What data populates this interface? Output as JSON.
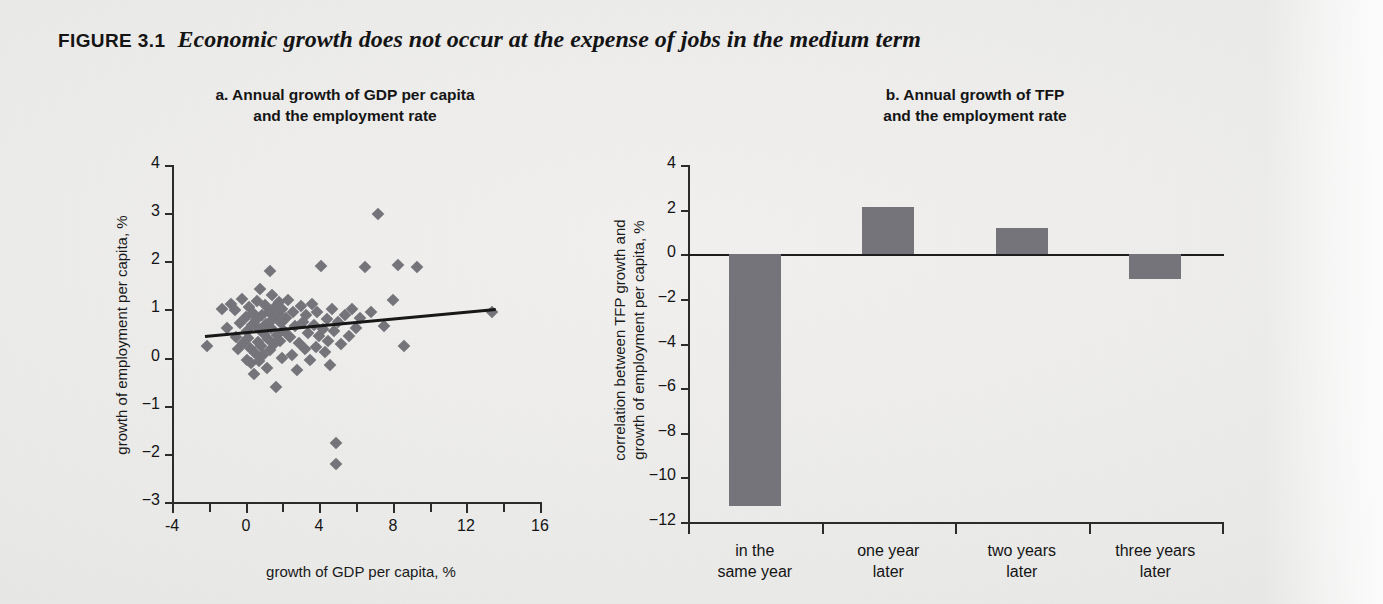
{
  "figure": {
    "tag": "FIGURE 3.1",
    "title": "Economic growth does not occur at the expense of jobs in the medium term"
  },
  "colors": {
    "marker": "#75747a",
    "bar": "#75747a",
    "axis": "#2b2b2b",
    "trendline": "#171717",
    "page_background": "#ececeb"
  },
  "panel_a": {
    "title_line1": "a.  Annual growth of GDP per capita",
    "title_line2": "and the employment rate",
    "chart_data": {
      "type": "scatter",
      "title": "a. Annual growth of GDP per capita and the employment rate",
      "xlabel": "growth of GDP per capita, %",
      "ylabel": "growth of employment per capita, %",
      "xlim": [
        -4,
        16
      ],
      "ylim": [
        -3,
        4
      ],
      "xticks": [
        -4,
        0,
        4,
        8,
        12,
        16
      ],
      "xtick_labels": [
        "-4",
        "0",
        "4",
        "8",
        "12",
        "16"
      ],
      "xminor_step": 2,
      "yticks": [
        -3,
        -2,
        -1,
        0,
        1,
        2,
        3,
        4
      ],
      "ytick_labels": [
        "−3",
        "−2",
        "−1",
        "0",
        "1",
        "2",
        "3",
        "4"
      ],
      "grid": false,
      "legend": "none",
      "trendline": {
        "x0": -2.2,
        "y0": 0.46,
        "x1": 13.6,
        "y1": 1.02
      },
      "points": [
        [
          -2.1,
          0.25
        ],
        [
          -1.3,
          1.0
        ],
        [
          -1.0,
          0.62
        ],
        [
          -0.8,
          1.12
        ],
        [
          -0.6,
          0.98
        ],
        [
          -0.5,
          0.43
        ],
        [
          -0.4,
          0.18
        ],
        [
          -0.3,
          0.72
        ],
        [
          -0.2,
          1.22
        ],
        [
          -0.15,
          0.3
        ],
        [
          0.0,
          0.85
        ],
        [
          0.05,
          0.55
        ],
        [
          0.1,
          -0.05
        ],
        [
          0.15,
          0.4
        ],
        [
          0.2,
          1.05
        ],
        [
          0.25,
          0.2
        ],
        [
          0.3,
          -0.12
        ],
        [
          0.35,
          0.68
        ],
        [
          0.4,
          0.92
        ],
        [
          0.45,
          -0.35
        ],
        [
          0.5,
          0.1
        ],
        [
          0.55,
          0.78
        ],
        [
          0.6,
          1.18
        ],
        [
          0.65,
          0.33
        ],
        [
          0.7,
          -0.08
        ],
        [
          0.75,
          0.6
        ],
        [
          0.8,
          1.42
        ],
        [
          0.85,
          0.25
        ],
        [
          0.9,
          0.88
        ],
        [
          0.95,
          0.05
        ],
        [
          1.0,
          0.5
        ],
        [
          1.05,
          1.1
        ],
        [
          1.1,
          0.7
        ],
        [
          1.15,
          -0.22
        ],
        [
          1.2,
          0.38
        ],
        [
          1.25,
          0.95
        ],
        [
          1.3,
          1.8
        ],
        [
          1.35,
          0.15
        ],
        [
          1.4,
          0.62
        ],
        [
          1.45,
          1.3
        ],
        [
          1.5,
          0.8
        ],
        [
          1.55,
          0.28
        ],
        [
          1.6,
          1.05
        ],
        [
          1.65,
          -0.6
        ],
        [
          1.7,
          0.48
        ],
        [
          1.75,
          0.9
        ],
        [
          1.8,
          1.15
        ],
        [
          1.85,
          0.35
        ],
        [
          1.9,
          0.72
        ],
        [
          1.95,
          0.0
        ],
        [
          2.0,
          1.0
        ],
        [
          2.1,
          0.55
        ],
        [
          2.2,
          0.82
        ],
        [
          2.3,
          1.2
        ],
        [
          2.4,
          0.42
        ],
        [
          2.5,
          0.05
        ],
        [
          2.6,
          0.95
        ],
        [
          2.7,
          0.65
        ],
        [
          2.8,
          -0.25
        ],
        [
          2.9,
          0.3
        ],
        [
          3.0,
          1.08
        ],
        [
          3.1,
          0.75
        ],
        [
          3.2,
          0.18
        ],
        [
          3.3,
          0.88
        ],
        [
          3.4,
          0.52
        ],
        [
          3.5,
          -0.05
        ],
        [
          3.6,
          1.12
        ],
        [
          3.7,
          0.68
        ],
        [
          3.8,
          0.22
        ],
        [
          3.9,
          0.95
        ],
        [
          4.0,
          0.45
        ],
        [
          4.1,
          1.9
        ],
        [
          4.2,
          0.6
        ],
        [
          4.3,
          0.12
        ],
        [
          4.4,
          0.8
        ],
        [
          4.5,
          0.35
        ],
        [
          4.6,
          -0.15
        ],
        [
          4.7,
          1.02
        ],
        [
          4.8,
          0.55
        ],
        [
          4.9,
          -1.78
        ],
        [
          4.9,
          -2.22
        ],
        [
          5.0,
          0.75
        ],
        [
          5.2,
          0.28
        ],
        [
          5.4,
          0.88
        ],
        [
          5.6,
          0.45
        ],
        [
          5.8,
          1.0
        ],
        [
          6.0,
          0.62
        ],
        [
          6.2,
          0.82
        ],
        [
          6.5,
          1.88
        ],
        [
          6.8,
          0.95
        ],
        [
          7.2,
          2.98
        ],
        [
          7.5,
          0.65
        ],
        [
          8.0,
          1.2
        ],
        [
          8.3,
          1.92
        ],
        [
          8.6,
          0.25
        ],
        [
          9.3,
          1.88
        ],
        [
          13.4,
          0.95
        ]
      ]
    }
  },
  "panel_b": {
    "title_line1": "b.  Annual growth of  TFP",
    "title_line2": "and the employment rate",
    "chart_data": {
      "type": "bar",
      "title": "b. Annual growth of TFP and the employment rate",
      "xlabel": "",
      "ylabel_line1": "correlation between TFP growth and",
      "ylabel_line2": "growth of employment per capita, %",
      "categories": [
        "in the\nsame year",
        "one year\nlater",
        "two years\nlater",
        "three years\nlater"
      ],
      "category_labels": [
        [
          "in the",
          "same year"
        ],
        [
          "one year",
          "later"
        ],
        [
          "two years",
          "later"
        ],
        [
          "three years",
          "later"
        ]
      ],
      "values": [
        -11.3,
        2.1,
        1.2,
        -1.1
      ],
      "ylim": [
        -12,
        4
      ],
      "yticks": [
        -12,
        -10,
        -8,
        -6,
        -4,
        -2,
        0,
        2,
        4
      ],
      "ytick_labels": [
        "−12",
        "−10",
        "−8",
        "−6",
        "−4",
        "−2",
        "0",
        "2",
        "4"
      ],
      "grid": false,
      "legend": "none"
    }
  }
}
